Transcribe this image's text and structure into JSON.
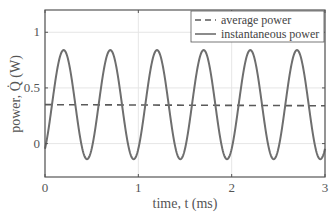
{
  "chart_data": {
    "type": "line",
    "title": "",
    "xlabel": "time, t (ms)",
    "ylabel": "power, Q̇ (W)",
    "xlim": [
      0,
      3
    ],
    "ylim": [
      -0.3,
      1.2
    ],
    "grid": true,
    "legend_position": "upper right",
    "x_ticks": [
      "0",
      "1",
      "2",
      "3"
    ],
    "y_ticks": [
      "0",
      "0.5",
      "1"
    ],
    "series": [
      {
        "name": "average power",
        "style": "dashed",
        "color": "#5a5a5a",
        "x": [
          0,
          3
        ],
        "values": [
          0.35,
          0.34
        ]
      },
      {
        "name": "instantaneous power",
        "style": "solid",
        "color": "#6e6e6e",
        "period_ms": 0.5,
        "mean": 0.35,
        "amplitude": 0.49,
        "peaks_t_ms": [
          0.2,
          0.7,
          1.2,
          1.7,
          2.2,
          2.7
        ],
        "peak_value": 0.84,
        "trough_value": -0.14,
        "x": [
          0,
          0.2,
          0.45,
          0.7,
          0.95,
          1.2,
          1.45,
          1.7,
          1.95,
          2.2,
          2.45,
          2.7,
          2.95,
          3.0
        ],
        "values": [
          -0.05,
          0.84,
          -0.14,
          0.84,
          -0.14,
          0.84,
          -0.14,
          0.84,
          -0.14,
          0.84,
          -0.14,
          0.84,
          -0.14,
          -0.05
        ]
      }
    ]
  }
}
